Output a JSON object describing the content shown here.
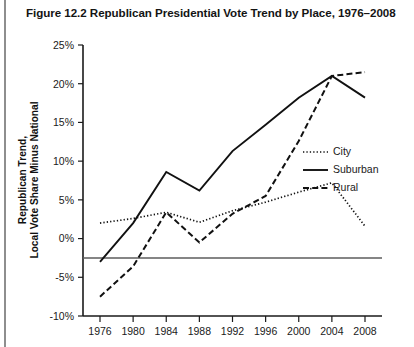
{
  "figure": {
    "number": "Figure 12.2",
    "title": "Figure 12.2  Republican Presidential Vote Trend by Place, 1976–2008"
  },
  "chart_data": {
    "type": "line",
    "title": "Republican Presidential Vote Trend by Place, 1976–2008",
    "xlabel": "",
    "ylabel": "Republican Trend, Local Vote Share Minus National",
    "ylabel_line1": "Republican Trend,",
    "ylabel_line2": "Local Vote Share Minus National",
    "categories": [
      "1976",
      "1980",
      "1984",
      "1988",
      "1992",
      "1996",
      "2000",
      "2004",
      "2008"
    ],
    "x": [
      1976,
      1980,
      1984,
      1988,
      1992,
      1996,
      2000,
      2004,
      2008
    ],
    "ylim": [
      -10,
      25
    ],
    "xlim": [
      1976,
      2008
    ],
    "ytick_labels": [
      "25%",
      "20%",
      "15%",
      "10%",
      "5%",
      "0%",
      "-5%",
      "-10%"
    ],
    "ytick_values": [
      25,
      20,
      15,
      10,
      5,
      0,
      -5,
      -10
    ],
    "xtick_labels": [
      "1976",
      "1980",
      "1984",
      "1988",
      "1992",
      "1996",
      "2000",
      "2004",
      "2008"
    ],
    "grid": false,
    "zero_line": true,
    "legend_position": "right-middle",
    "series": [
      {
        "name": "City",
        "style": "dotted",
        "color": "#111111",
        "values": [
          2.0,
          2.6,
          3.4,
          2.1,
          3.6,
          4.7,
          6.0,
          7.2,
          1.6
        ]
      },
      {
        "name": "Suburban",
        "style": "solid",
        "color": "#111111",
        "values": [
          -3.0,
          2.0,
          8.6,
          6.2,
          11.3,
          14.7,
          18.2,
          21.0,
          18.2
        ]
      },
      {
        "name": "Rural",
        "style": "dashed",
        "color": "#111111",
        "values": [
          -7.5,
          -3.6,
          3.4,
          -0.5,
          3.2,
          5.5,
          12.6,
          21.0,
          21.5
        ]
      }
    ]
  },
  "legend": {
    "items": [
      {
        "label": "City",
        "style": "dotted"
      },
      {
        "label": "Suburban",
        "style": "solid"
      },
      {
        "label": "Rural",
        "style": "dashed"
      }
    ]
  }
}
